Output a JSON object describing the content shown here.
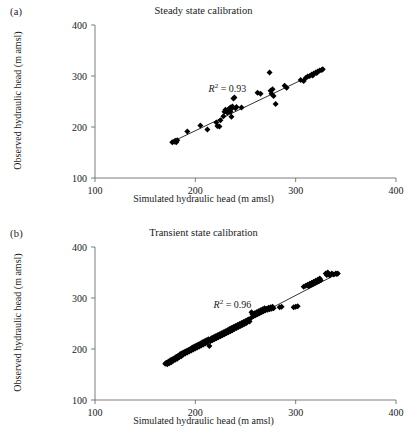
{
  "figure": {
    "width": 407,
    "height": 445,
    "marker_color": "#000000",
    "line_color": "#000000",
    "axis_color": "#6e6e6e"
  },
  "panels": [
    {
      "label": "(a)",
      "title": "Steady state calibration",
      "annotation": "R² = 0.93",
      "annotation_value": "0.93",
      "annotation_symbol": "R",
      "annotation_exponent": "2",
      "annotation_equals": "= 0.93"
    },
    {
      "label": "(b)",
      "title": "Transient state calibration",
      "annotation": "R² = 0.96",
      "annotation_value": "0.96",
      "annotation_symbol": "R",
      "annotation_exponent": "2",
      "annotation_equals": "= 0.96"
    }
  ],
  "axes": {
    "xlabel": "Simulated hydraulic head (m amsl)",
    "ylabel": "Observed hydraulic head (m amsl)",
    "xticks": [
      "100",
      "200",
      "300",
      "400"
    ],
    "yticks": [
      "100",
      "200",
      "300",
      "400"
    ]
  },
  "chart_data": [
    {
      "type": "scatter",
      "title": "Steady state calibration",
      "panel": "(a)",
      "xlabel": "Simulated hydraulic head (m amsl)",
      "ylabel": "Observed hydraulic head (m amsl)",
      "xlim": [
        100,
        400
      ],
      "ylim": [
        100,
        400
      ],
      "xticks": [
        100,
        200,
        300,
        400
      ],
      "yticks": [
        100,
        200,
        300,
        400
      ],
      "grid": false,
      "legend": "none",
      "annotations": [
        {
          "text": "R² = 0.93",
          "x": 232,
          "y": 268
        }
      ],
      "r_squared": 0.93,
      "marker": "diamond",
      "fit_line": {
        "x": [
          178,
          328
        ],
        "y": [
          172,
          313
        ]
      },
      "points": [
        [
          177,
          170
        ],
        [
          179,
          171
        ],
        [
          180,
          173
        ],
        [
          181,
          170
        ],
        [
          182,
          174
        ],
        [
          192,
          191
        ],
        [
          205,
          203
        ],
        [
          212,
          195
        ],
        [
          221,
          209
        ],
        [
          222,
          202
        ],
        [
          224,
          201
        ],
        [
          225,
          213
        ],
        [
          228,
          221
        ],
        [
          229,
          230
        ],
        [
          230,
          234
        ],
        [
          231,
          232
        ],
        [
          232,
          228
        ],
        [
          233,
          235
        ],
        [
          234,
          233
        ],
        [
          235,
          230
        ],
        [
          235,
          238
        ],
        [
          236,
          236
        ],
        [
          236,
          220
        ],
        [
          237,
          240
        ],
        [
          238,
          256
        ],
        [
          239,
          258
        ],
        [
          240,
          237
        ],
        [
          241,
          239
        ],
        [
          246,
          238
        ],
        [
          262,
          267
        ],
        [
          265,
          265
        ],
        [
          274,
          307
        ],
        [
          275,
          271
        ],
        [
          276,
          265
        ],
        [
          277,
          274
        ],
        [
          278,
          261
        ],
        [
          280,
          245
        ],
        [
          289,
          281
        ],
        [
          291,
          277
        ],
        [
          305,
          292
        ],
        [
          308,
          290
        ],
        [
          310,
          296
        ],
        [
          312,
          299
        ],
        [
          314,
          300
        ],
        [
          316,
          303
        ],
        [
          317,
          301
        ],
        [
          318,
          305
        ],
        [
          320,
          307
        ],
        [
          321,
          306
        ],
        [
          322,
          309
        ],
        [
          324,
          311
        ],
        [
          326,
          312
        ],
        [
          327,
          313
        ]
      ]
    },
    {
      "type": "scatter",
      "title": "Transient state calibration",
      "panel": "(b)",
      "xlabel": "Simulated hydraulic head (m amsl)",
      "ylabel": "Observed hydraulic head (m amsl)",
      "xlim": [
        100,
        400
      ],
      "ylim": [
        100,
        400
      ],
      "xticks": [
        100,
        200,
        300,
        400
      ],
      "yticks": [
        100,
        200,
        300,
        400
      ],
      "grid": false,
      "legend": "none",
      "annotations": [
        {
          "text": "R² = 0.96",
          "x": 237,
          "y": 281
        }
      ],
      "r_squared": 0.96,
      "marker": "diamond",
      "fit_line": {
        "x": [
          170,
          342
        ],
        "y": [
          172,
          348
        ]
      },
      "points": [
        [
          170,
          171
        ],
        [
          171,
          173
        ],
        [
          172,
          170
        ],
        [
          173,
          175
        ],
        [
          174,
          172
        ],
        [
          175,
          178
        ],
        [
          176,
          174
        ],
        [
          177,
          180
        ],
        [
          178,
          177
        ],
        [
          179,
          182
        ],
        [
          180,
          179
        ],
        [
          181,
          185
        ],
        [
          182,
          181
        ],
        [
          183,
          187
        ],
        [
          184,
          184
        ],
        [
          185,
          190
        ],
        [
          186,
          186
        ],
        [
          187,
          192
        ],
        [
          188,
          189
        ],
        [
          189,
          194
        ],
        [
          190,
          191
        ],
        [
          191,
          196
        ],
        [
          192,
          193
        ],
        [
          193,
          198
        ],
        [
          194,
          195
        ],
        [
          195,
          200
        ],
        [
          196,
          197
        ],
        [
          197,
          203
        ],
        [
          198,
          199
        ],
        [
          199,
          205
        ],
        [
          200,
          201
        ],
        [
          201,
          207
        ],
        [
          202,
          203
        ],
        [
          203,
          209
        ],
        [
          204,
          205
        ],
        [
          205,
          211
        ],
        [
          206,
          207
        ],
        [
          207,
          213
        ],
        [
          208,
          209
        ],
        [
          209,
          215
        ],
        [
          210,
          211
        ],
        [
          211,
          217
        ],
        [
          212,
          213
        ],
        [
          213,
          219
        ],
        [
          214,
          206
        ],
        [
          215,
          215
        ],
        [
          216,
          221
        ],
        [
          217,
          217
        ],
        [
          218,
          223
        ],
        [
          219,
          219
        ],
        [
          220,
          225
        ],
        [
          221,
          221
        ],
        [
          222,
          227
        ],
        [
          223,
          223
        ],
        [
          224,
          229
        ],
        [
          225,
          225
        ],
        [
          226,
          231
        ],
        [
          227,
          227
        ],
        [
          228,
          233
        ],
        [
          229,
          229
        ],
        [
          230,
          235
        ],
        [
          231,
          231
        ],
        [
          232,
          237
        ],
        [
          233,
          233
        ],
        [
          234,
          239
        ],
        [
          235,
          235
        ],
        [
          236,
          241
        ],
        [
          237,
          237
        ],
        [
          238,
          243
        ],
        [
          239,
          239
        ],
        [
          240,
          245
        ],
        [
          241,
          241
        ],
        [
          242,
          247
        ],
        [
          243,
          243
        ],
        [
          244,
          249
        ],
        [
          245,
          245
        ],
        [
          246,
          251
        ],
        [
          247,
          247
        ],
        [
          248,
          253
        ],
        [
          249,
          249
        ],
        [
          250,
          255
        ],
        [
          251,
          251
        ],
        [
          252,
          257
        ],
        [
          253,
          258
        ],
        [
          254,
          254
        ],
        [
          255,
          260
        ],
        [
          256,
          272
        ],
        [
          257,
          268
        ],
        [
          258,
          264
        ],
        [
          259,
          270
        ],
        [
          260,
          266
        ],
        [
          261,
          272
        ],
        [
          262,
          268
        ],
        [
          263,
          274
        ],
        [
          264,
          270
        ],
        [
          265,
          276
        ],
        [
          266,
          272
        ],
        [
          267,
          278
        ],
        [
          268,
          274
        ],
        [
          269,
          280
        ],
        [
          270,
          276
        ],
        [
          271,
          279
        ],
        [
          272,
          277
        ],
        [
          273,
          281
        ],
        [
          274,
          278
        ],
        [
          275,
          282
        ],
        [
          276,
          279
        ],
        [
          277,
          283
        ],
        [
          278,
          280
        ],
        [
          284,
          282
        ],
        [
          286,
          283
        ],
        [
          298,
          282
        ],
        [
          300,
          283
        ],
        [
          302,
          284
        ],
        [
          308,
          322
        ],
        [
          310,
          324
        ],
        [
          312,
          326
        ],
        [
          313,
          323
        ],
        [
          314,
          328
        ],
        [
          315,
          325
        ],
        [
          316,
          330
        ],
        [
          317,
          327
        ],
        [
          318,
          332
        ],
        [
          319,
          329
        ],
        [
          320,
          334
        ],
        [
          321,
          331
        ],
        [
          322,
          336
        ],
        [
          323,
          333
        ],
        [
          324,
          338
        ],
        [
          325,
          335
        ],
        [
          330,
          348
        ],
        [
          331,
          345
        ],
        [
          332,
          350
        ],
        [
          333,
          347
        ],
        [
          334,
          344
        ],
        [
          336,
          348
        ],
        [
          338,
          346
        ],
        [
          340,
          348
        ],
        [
          341,
          347
        ],
        [
          342,
          348
        ]
      ]
    }
  ]
}
